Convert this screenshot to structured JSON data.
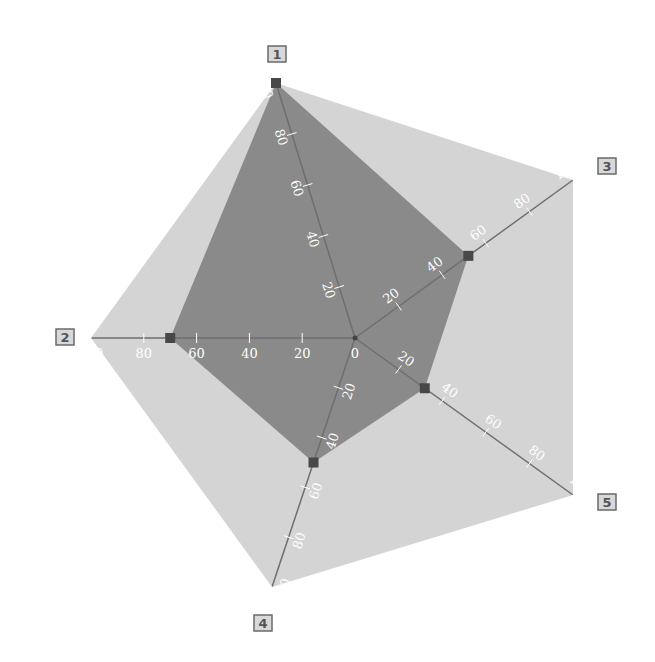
{
  "chart_data": {
    "type": "radar",
    "title": "",
    "axes": [
      "1",
      "2",
      "3",
      "4",
      "5"
    ],
    "axis_order_clockwise_from_top": [
      "1",
      "3",
      "5",
      "4",
      "2"
    ],
    "range": [
      0,
      100
    ],
    "ticks": [
      0,
      20,
      40,
      60,
      80,
      100
    ],
    "series": [
      {
        "name": "max",
        "values": {
          "1": 100,
          "2": 100,
          "3": 100,
          "4": 100,
          "5": 100
        },
        "fill": "#d4d4d4",
        "markers": false
      },
      {
        "name": "values",
        "values": {
          "1": 100,
          "2": 70,
          "3": 52,
          "4": 50,
          "5": 32
        },
        "fill": "#8a8a8a",
        "markers": true,
        "marker_color": "#4a4a4a"
      }
    ],
    "legend": null,
    "grid": false
  },
  "colors": {
    "outer_fill": "#d4d4d4",
    "inner_fill": "#8a8a8a",
    "axis_line": "#6e6e6e",
    "marker": "#484848",
    "tick_label": "#ffffff",
    "axis_box_fill": "#d8d8d8",
    "axis_box_stroke": "#6a6a6a"
  }
}
